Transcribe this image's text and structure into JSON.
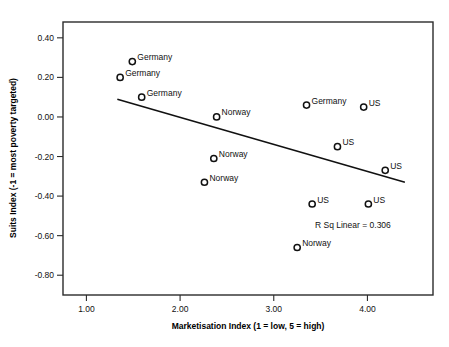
{
  "chart_data": {
    "type": "scatter",
    "title": "",
    "subtitle": "",
    "xlabel": "Marketisation Index (1 = low, 5 = high)",
    "ylabel": "Suits Index (-1 = most poverty targeted)",
    "xlim": [
      0.75,
      4.7
    ],
    "ylim": [
      -0.9,
      0.48
    ],
    "xticks": [
      1.0,
      2.0,
      3.0,
      4.0
    ],
    "xticklabels": [
      "1.00",
      "2.00",
      "3.00",
      "4.00"
    ],
    "yticks": [
      0.4,
      0.2,
      0.0,
      -0.2,
      -0.4,
      -0.6,
      -0.8
    ],
    "yticklabels": [
      "0.40",
      "0.20",
      "0.00",
      "-0.20",
      "-0.40",
      "-0.60",
      "-0.80"
    ],
    "grid": false,
    "legend": false,
    "marker": "open-circle",
    "points": [
      {
        "label": "Germany",
        "x": 1.49,
        "y": 0.28,
        "label_side": "right"
      },
      {
        "label": "Germany",
        "x": 1.36,
        "y": 0.2,
        "label_side": "right"
      },
      {
        "label": "Germany",
        "x": 1.59,
        "y": 0.1,
        "label_side": "right"
      },
      {
        "label": "Germany",
        "x": 3.35,
        "y": 0.06,
        "label_side": "right"
      },
      {
        "label": "US",
        "x": 3.96,
        "y": 0.05,
        "label_side": "right"
      },
      {
        "label": "Norway",
        "x": 2.39,
        "y": 0.0,
        "label_side": "right"
      },
      {
        "label": "US",
        "x": 3.68,
        "y": -0.15,
        "label_side": "right"
      },
      {
        "label": "Norway",
        "x": 2.36,
        "y": -0.21,
        "label_side": "right"
      },
      {
        "label": "US",
        "x": 4.19,
        "y": -0.27,
        "label_side": "right"
      },
      {
        "label": "Norway",
        "x": 2.26,
        "y": -0.33,
        "label_side": "right"
      },
      {
        "label": "US",
        "x": 3.41,
        "y": -0.44,
        "label_side": "right"
      },
      {
        "label": "US",
        "x": 4.01,
        "y": -0.44,
        "label_side": "right"
      },
      {
        "label": "Norway",
        "x": 3.25,
        "y": -0.66,
        "label_side": "right"
      }
    ],
    "fit_line": {
      "type": "linear",
      "x0": 1.33,
      "y0": 0.09,
      "x1": 4.4,
      "y1": -0.33
    },
    "annotations": [
      {
        "text": "R Sq Linear = 0.306",
        "x": 4.25,
        "y": -0.56,
        "anchor": "end"
      }
    ],
    "colors": {
      "marker_stroke": "#111111",
      "marker_fill": "#ffffff",
      "fit_line": "#111111",
      "axis": "#2b2b2b",
      "text": "#111111",
      "background": "#ffffff"
    }
  }
}
